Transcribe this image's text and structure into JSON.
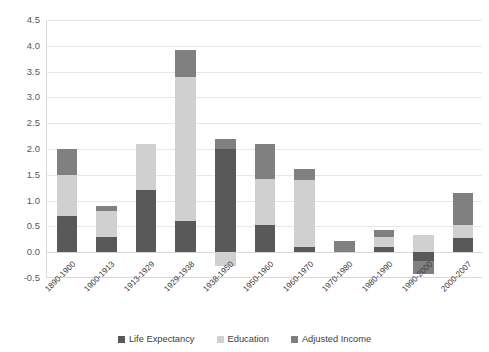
{
  "chart_data": {
    "type": "bar",
    "subtype": "stacked-bar",
    "title": "",
    "xlabel": "",
    "ylabel": "",
    "ylim": [
      -0.5,
      4.5
    ],
    "ytick_step": 0.5,
    "yticks": [
      "4.5",
      "4.0",
      "3.5",
      "3.0",
      "2.5",
      "2.0",
      "1.5",
      "1.0",
      "0.5",
      "0.0",
      "-0.5"
    ],
    "grid": true,
    "grid_axis": "y",
    "legend_position": "bottom",
    "categories": [
      "1890-1900",
      "1900-1913",
      "1913-1929",
      "1929-1938",
      "1938-1950",
      "1950-1960",
      "1960-1970",
      "1970-1980",
      "1980-1990",
      "1990-2000",
      "2000-2007"
    ],
    "series": [
      {
        "name": "Life Expectancy",
        "color": "#595959",
        "values": [
          0.7,
          0.3,
          1.2,
          0.61,
          2.0,
          0.52,
          0.11,
          0.0,
          0.11,
          -0.17,
          0.28
        ]
      },
      {
        "name": "Education",
        "color": "#d0d0d0",
        "values": [
          0.8,
          0.5,
          0.9,
          2.79,
          -0.27,
          0.9,
          1.29,
          0.0,
          0.19,
          0.33,
          0.24
        ]
      },
      {
        "name": "Adjusted Income",
        "color": "#808080",
        "values": [
          0.5,
          0.1,
          0.0,
          0.52,
          0.2,
          0.68,
          0.22,
          0.21,
          0.13,
          -0.25,
          0.62
        ]
      }
    ],
    "totals": [
      2.0,
      0.9,
      2.1,
      3.92,
      1.93,
      2.1,
      1.62,
      0.21,
      0.43,
      -0.09,
      1.14
    ]
  },
  "legend": {
    "items": [
      {
        "label": "Life Expectancy",
        "color": "#595959",
        "swatch": "square-swatch"
      },
      {
        "label": "Education",
        "color": "#d0d0d0",
        "swatch": "square-swatch"
      },
      {
        "label": "Adjusted Income",
        "color": "#808080",
        "swatch": "square-swatch"
      }
    ]
  }
}
